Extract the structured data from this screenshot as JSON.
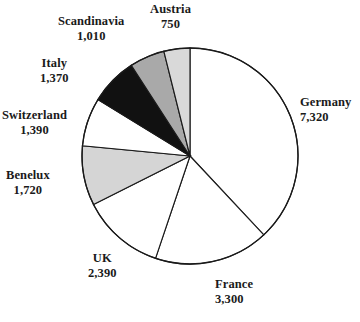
{
  "chart_data": {
    "type": "pie",
    "title": "",
    "subtitle": "",
    "xlabel": "",
    "ylabel": "",
    "legend_position": "none",
    "grid": false,
    "total": 20250,
    "units": "",
    "start_angle_deg": 0,
    "direction": "clockwise",
    "categories": [
      "Germany",
      "France",
      "UK",
      "Benelux",
      "Switzerland",
      "Italy",
      "Scandinavia",
      "Austria"
    ],
    "values": [
      7320,
      3300,
      2390,
      1720,
      1390,
      1370,
      1010,
      750
    ],
    "value_labels": [
      "7,320",
      "3,300",
      "2,390",
      "1,720",
      "1,390",
      "1,370",
      "1,010",
      "750"
    ],
    "slice_colors": [
      "#ffffff",
      "#ffffff",
      "#ffffff",
      "#d5d5d5",
      "#ffffff",
      "#111111",
      "#a9a9a9",
      "#d9d9d9"
    ],
    "slices": [
      {
        "name": "Germany",
        "value": 7320,
        "value_label": "7,320",
        "color": "#ffffff",
        "percent": 36.1
      },
      {
        "name": "France",
        "value": 3300,
        "value_label": "3,300",
        "color": "#ffffff",
        "percent": 16.3
      },
      {
        "name": "UK",
        "value": 2390,
        "value_label": "2,390",
        "color": "#ffffff",
        "percent": 11.8
      },
      {
        "name": "Benelux",
        "value": 1720,
        "value_label": "1,720",
        "color": "#d5d5d5",
        "percent": 8.5
      },
      {
        "name": "Switzerland",
        "value": 1390,
        "value_label": "1,390",
        "color": "#ffffff",
        "percent": 6.9
      },
      {
        "name": "Italy",
        "value": 1370,
        "value_label": "1,370",
        "color": "#111111",
        "percent": 6.8
      },
      {
        "name": "Scandinavia",
        "value": 1010,
        "value_label": "1,010",
        "color": "#a9a9a9",
        "percent": 5.0
      },
      {
        "name": "Austria",
        "value": 750,
        "value_label": "750",
        "color": "#d9d9d9",
        "percent": 3.7
      }
    ]
  },
  "geometry": {
    "center_x": 190,
    "center_y": 156,
    "radius": 108
  },
  "style": {
    "outline_color": "#1a1a1a",
    "background": "#ffffff",
    "text_color": "#1a1a1a"
  },
  "labels": [
    {
      "name": "Germany",
      "value_label": "7,320",
      "left": 300,
      "top": 95,
      "align": "left"
    },
    {
      "name": "France",
      "value_label": "3,300",
      "left": 215,
      "top": 277,
      "align": "left"
    },
    {
      "name": "UK",
      "value_label": "2,390",
      "left": 88,
      "top": 251,
      "align": "center"
    },
    {
      "name": "Benelux",
      "value_label": "1,720",
      "left": 6,
      "top": 168,
      "align": "center"
    },
    {
      "name": "Switzerland",
      "value_label": "1,390",
      "left": 2,
      "top": 108,
      "align": "center"
    },
    {
      "name": "Italy",
      "value_label": "1,370",
      "left": 40,
      "top": 56,
      "align": "center"
    },
    {
      "name": "Scandinavia",
      "value_label": "1,010",
      "left": 58,
      "top": 14,
      "align": "center"
    },
    {
      "name": "Austria",
      "value_label": "750",
      "left": 150,
      "top": 2,
      "align": "center"
    }
  ]
}
